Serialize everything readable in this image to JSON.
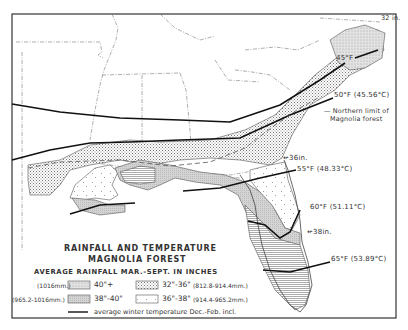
{
  "map": {
    "title_line1": "RAINFALL AND TEMPERATURE",
    "title_line2": "MAGNOLIA FOREST",
    "subtitle": "AVERAGE RAINFALL MAR.-SEPT. IN INCHES",
    "isotherms": [
      {
        "label": "45°F"
      },
      {
        "label": "50°F (45.56°C)"
      },
      {
        "label": "55°F (48.33°C)"
      },
      {
        "label": "60°F (51.11°C)"
      },
      {
        "label": "65°F (53.89°C)"
      }
    ],
    "rainfall_markers": [
      {
        "label": "32 in."
      },
      {
        "label": "36in."
      },
      {
        "label": "38in."
      }
    ],
    "northern_limit_line1": "Northern limit of",
    "northern_limit_line2": "Magnolia forest",
    "legend": {
      "items": [
        {
          "mm": "(1016mm.)",
          "inches": "40\"+",
          "pattern": "stipple-grey"
        },
        {
          "mm": "(965.2-1016mm.)",
          "inches": "38\"-40\"",
          "pattern": "fine-grey"
        },
        {
          "inches": "32\"-36\"",
          "mm": "(812.8-914.4mm.)",
          "pattern": "dense-dots"
        },
        {
          "inches": "36\"-38\"",
          "mm": "(914.4-965.2mm.)",
          "pattern": "sparse-ticks"
        }
      ],
      "line_label": "average winter temperature Dec.-Feb. incl."
    }
  },
  "colors": {
    "ink": "#222222",
    "border": "#333333",
    "shade_light": "#d8d8d8",
    "shade_mid": "#c4c4c4",
    "background": "#ffffff"
  }
}
